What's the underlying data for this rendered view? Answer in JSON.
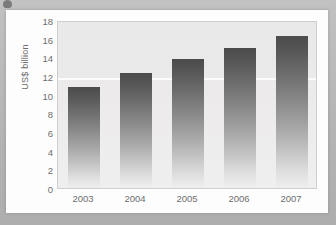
{
  "chart_data": {
    "type": "bar",
    "title": "",
    "subtitle": "",
    "xlabel": "",
    "ylabel": "US$ billion",
    "categories": [
      "2003",
      "2004",
      "2005",
      "2006",
      "2007"
    ],
    "values": [
      10.8,
      12.3,
      13.8,
      15.0,
      16.3
    ],
    "series": [
      {
        "name": "US$ billion",
        "values": [
          10.8,
          12.3,
          13.8,
          15.0,
          16.3
        ]
      }
    ],
    "ylim": [
      0,
      18
    ],
    "ytick_labels": [
      "0",
      "2",
      "4",
      "6",
      "8",
      "10",
      "12",
      "14",
      "16",
      "18"
    ],
    "ytick_values": [
      0,
      2,
      4,
      6,
      8,
      10,
      12,
      14,
      16,
      18
    ],
    "xtick_labels": [
      "2003",
      "2004",
      "2005",
      "2006",
      "2007"
    ],
    "grid": true,
    "gridline_values": [
      12
    ],
    "legend": false,
    "legend_position": "none",
    "annotations": [],
    "colors": {
      "bar_top": "#4b4b4b",
      "bar_bottom": "#efefef",
      "plot_background": "#ececec",
      "plot_border": "#cfcfcf",
      "card_background": "#fdfdfd",
      "page_background": "#b9b9b9",
      "tick_text": "#6e6e6e",
      "axis_title_text": "#6b6b6b",
      "gridline": "#ffffff"
    }
  }
}
